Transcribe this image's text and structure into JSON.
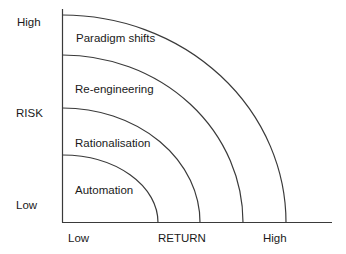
{
  "diagram": {
    "y_axis": {
      "title": "RISK",
      "high_label": "High",
      "low_label": "Low"
    },
    "x_axis": {
      "title": "RETURN",
      "low_label": "Low",
      "high_label": "High"
    },
    "zones": [
      {
        "label": "Automation",
        "order": 1
      },
      {
        "label": "Rationalisation",
        "order": 2
      },
      {
        "label": "Re-engineering",
        "order": 3
      },
      {
        "label": "Paradigm shifts",
        "order": 4
      }
    ],
    "colors": {
      "line": "#3a3a3a",
      "text": "#1a1a1a",
      "background": "#ffffff"
    }
  }
}
